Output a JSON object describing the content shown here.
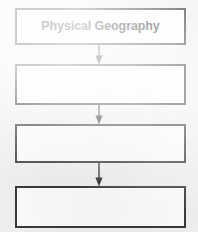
{
  "diagram": {
    "type": "vertical-flowchart",
    "title": "Physical Geography",
    "orientation": "top-to-bottom",
    "background_color": "#f1f1f0",
    "box_fill_color": "#fdfdfd",
    "box_border_color": "#3a3a3a",
    "text_color": "#211f20",
    "arrow_color": "#2f2f2f",
    "node_count": 4,
    "connector_count": 3,
    "nodes": [
      {
        "id": "node-1",
        "label": "Physical Geography",
        "filled": true,
        "bold": true
      },
      {
        "id": "node-2",
        "label": "",
        "filled": false,
        "bold": false
      },
      {
        "id": "node-3",
        "label": "",
        "filled": false,
        "bold": false
      },
      {
        "id": "node-4",
        "label": "",
        "filled": false,
        "bold": false
      }
    ],
    "connectors": [
      {
        "id": "connector-1",
        "from": "node-1",
        "to": "node-2",
        "style": "arrow-down"
      },
      {
        "id": "connector-2",
        "from": "node-2",
        "to": "node-3",
        "style": "arrow-down"
      },
      {
        "id": "connector-3",
        "from": "node-3",
        "to": "node-4",
        "style": "arrow-down"
      }
    ]
  }
}
